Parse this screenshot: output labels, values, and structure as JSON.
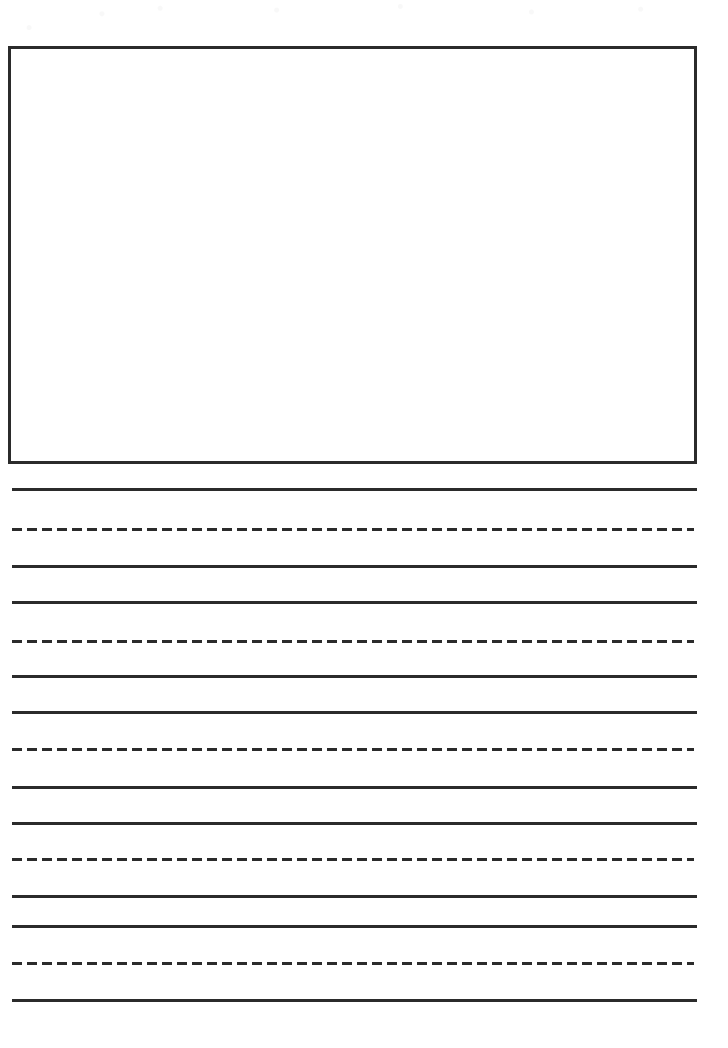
{
  "page": {
    "sheet_type": "draw-and-write handwriting worksheet",
    "width_px": 728,
    "height_px": 1048,
    "background_color": "#ffffff",
    "ink_color": "#2b2b2b"
  },
  "drawing_box": {
    "name": "illustration-box",
    "label": "",
    "x": 8,
    "y": 46,
    "width": 689,
    "height": 418,
    "border_width_px": 3,
    "border_color": "#2b2b2b",
    "fill_color": "#ffffff"
  },
  "writing_area": {
    "line_left_x": 12,
    "line_right_x": 697,
    "dashed_right_x": 694,
    "line_thickness_px": 3,
    "line_color": "#2b2b2b",
    "dash_length_px": 10,
    "dash_gap_px": 5,
    "group_count": 4,
    "line_count": 15,
    "lines": [
      {
        "index": 0,
        "style": "solid",
        "role": "top-line",
        "y": 488
      },
      {
        "index": 1,
        "style": "dashed",
        "role": "midline",
        "y": 528
      },
      {
        "index": 2,
        "style": "solid",
        "role": "baseline",
        "y": 565
      },
      {
        "index": 3,
        "style": "solid",
        "role": "top-line",
        "y": 601
      },
      {
        "index": 4,
        "style": "dashed",
        "role": "midline",
        "y": 640
      },
      {
        "index": 5,
        "style": "solid",
        "role": "baseline",
        "y": 675
      },
      {
        "index": 6,
        "style": "solid",
        "role": "top-line",
        "y": 711
      },
      {
        "index": 7,
        "style": "dashed",
        "role": "midline",
        "y": 748
      },
      {
        "index": 8,
        "style": "solid",
        "role": "baseline",
        "y": 786
      },
      {
        "index": 9,
        "style": "solid",
        "role": "top-line",
        "y": 822
      },
      {
        "index": 10,
        "style": "dashed",
        "role": "midline",
        "y": 858
      },
      {
        "index": 11,
        "style": "solid",
        "role": "baseline",
        "y": 895
      },
      {
        "index": 12,
        "style": "solid",
        "role": "top-line",
        "y": 925
      },
      {
        "index": 13,
        "style": "dashed",
        "role": "midline",
        "y": 962
      },
      {
        "index": 14,
        "style": "solid",
        "role": "baseline",
        "y": 999
      }
    ]
  }
}
